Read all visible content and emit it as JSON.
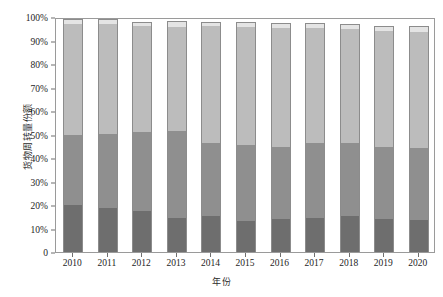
{
  "chart_data": {
    "type": "bar",
    "title": "",
    "subtitle": "",
    "xlabel": "年份",
    "ylabel": "货物周转量份额",
    "categories": [
      "2010",
      "2011",
      "2012",
      "2013",
      "2014",
      "2015",
      "2016",
      "2017",
      "2018",
      "2019",
      "2020"
    ],
    "ylim": [
      0,
      100
    ],
    "ytick_labels": [
      "0",
      "10%",
      "20%",
      "30%",
      "40%",
      "50%",
      "60%",
      "70%",
      "80%",
      "90%",
      "100%"
    ],
    "ytick_values": [
      0,
      10,
      20,
      30,
      40,
      50,
      60,
      70,
      80,
      90,
      100
    ],
    "grid": false,
    "legend": "none",
    "stacked": true,
    "series": [
      {
        "name": "segment-1",
        "color": "#6e6e6e",
        "values": [
          19.8,
          18.6,
          17.3,
          14.6,
          15.4,
          13.2,
          14.0,
          14.6,
          15.2,
          14.2,
          13.6
        ]
      },
      {
        "name": "segment-2",
        "color": "#8f8f8f",
        "values": [
          29.9,
          31.8,
          33.9,
          37.0,
          31.1,
          32.2,
          30.8,
          31.6,
          31.4,
          30.6,
          30.6
        ]
      },
      {
        "name": "segment-3",
        "color": "#bcbcbc",
        "values": [
          47.3,
          46.7,
          45.0,
          44.3,
          49.6,
          50.3,
          50.6,
          49.1,
          48.2,
          49.2,
          49.4
        ]
      },
      {
        "name": "segment-4",
        "color": "#e4e4e4",
        "values": [
          2.3,
          1.9,
          1.8,
          2.6,
          1.9,
          2.3,
          2.1,
          2.2,
          2.2,
          2.3,
          2.4
        ]
      }
    ],
    "totals": [
      99.3,
      99.0,
      98.0,
      98.5,
      98.0,
      98.0,
      97.5,
      97.5,
      97.0,
      96.3,
      96.0
    ]
  },
  "layout": {
    "plot_left": 55,
    "plot_top": 18,
    "plot_width": 380,
    "plot_height": 235,
    "bar_width": 20,
    "axis_color": "#9a9a9a",
    "bar_edge_color": "#8c8c8c",
    "text_color": "#1d1d1d"
  }
}
